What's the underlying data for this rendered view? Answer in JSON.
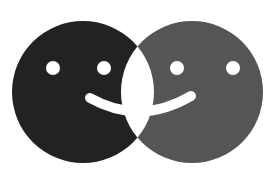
{
  "image": {
    "description": "Two overlapping smiley faces sharing one smile",
    "background": "#ffffff",
    "faces": [
      {
        "name": "left-face",
        "color": "#222222"
      },
      {
        "name": "right-face",
        "color": "#555555"
      }
    ],
    "feature_color": "#ffffff"
  }
}
